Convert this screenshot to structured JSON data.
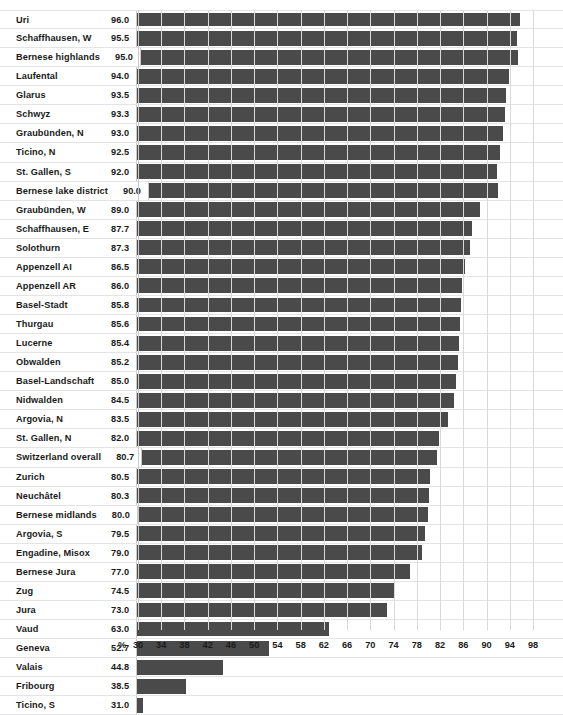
{
  "top_caption": "",
  "chart_data": {
    "type": "bar",
    "orientation": "horizontal",
    "title": "",
    "subtitle": "",
    "xlabel": "%",
    "ylabel": "",
    "xlim": [
      30,
      98
    ],
    "xticks": [
      30,
      34,
      38,
      42,
      46,
      50,
      54,
      58,
      62,
      66,
      70,
      74,
      78,
      82,
      86,
      90,
      94,
      98
    ],
    "xtick_labels": [
      "30",
      "34",
      "38",
      "42",
      "46",
      "50",
      "54",
      "58",
      "62",
      "66",
      "70",
      "74",
      "78",
      "82",
      "86",
      "90",
      "94",
      "98"
    ],
    "grid": "vertical",
    "legend": "none",
    "bar_color": "#4a4a4a",
    "gridline_color": "#d9d9dc",
    "row_separator_color": "#e4e4e6",
    "categories": [
      "Uri",
      "Schaffhausen, W",
      "Bernese highlands",
      "Laufental",
      "Glarus",
      "Schwyz",
      "Graubünden, N",
      "Ticino, N",
      "St. Gallen, S",
      "Bernese lake district",
      "Graubünden, W",
      "Schaffhausen, E",
      "Solothurn",
      "Appenzell AI",
      "Appenzell AR",
      "Basel-Stadt",
      "Thurgau",
      "Lucerne",
      "Obwalden",
      "Basel-Landschaft",
      "Nidwalden",
      "Argovia, N",
      "St. Gallen, N",
      "Switzerland overall",
      "Zurich",
      "Neuchâtel",
      "Bernese midlands",
      "Argovia, S",
      "Engadine, Misox",
      "Bernese Jura",
      "Zug",
      "Jura",
      "Vaud",
      "Geneva",
      "Valais",
      "Fribourg",
      "Ticino, S"
    ],
    "values": [
      96.0,
      95.5,
      95.0,
      94.0,
      93.5,
      93.3,
      93.0,
      92.5,
      92.0,
      90.0,
      89.0,
      87.7,
      87.3,
      86.5,
      86.0,
      85.8,
      85.6,
      85.4,
      85.2,
      85.0,
      84.5,
      83.5,
      82.0,
      80.7,
      80.5,
      80.3,
      80.0,
      79.5,
      79.0,
      77.0,
      74.5,
      73.0,
      63.0,
      52.7,
      44.8,
      38.5,
      31.0
    ],
    "value_labels": [
      "96.0",
      "95.5",
      "95.0",
      "94.0",
      "93.5",
      "93.3",
      "93.0",
      "92.5",
      "92.0",
      "90.0",
      "89.0",
      "87.7",
      "87.3",
      "86.5",
      "86.0",
      "85.8",
      "85.6",
      "85.4",
      "85.2",
      "85.0",
      "84.5",
      "83.5",
      "82.0",
      "80.7",
      "80.5",
      "80.3",
      "80.0",
      "79.5",
      "79.0",
      "77.0",
      "74.5",
      "73.0",
      "63.0",
      "52.7",
      "44.8",
      "38.5",
      "31.0"
    ]
  }
}
